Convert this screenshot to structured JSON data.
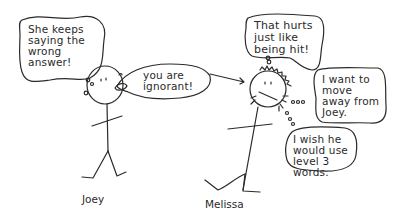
{
  "characters": {
    "joey": {
      "name": "Joey"
    },
    "melissa": {
      "name": "Melissa"
    }
  },
  "bubbles": {
    "joey_thought": "She keeps\nsaying the\nwrong\nanswer!",
    "joey_speech": "you are\nignorant!",
    "melissa_thought_1": "That hurts\njust like\nbeing hit!",
    "melissa_thought_2": "I want to\nmove\naway from\nJoey.",
    "melissa_thought_3": "I wish he\nwould use\nlevel 3\nwords."
  },
  "colors": {
    "ink": "#2a2a2a",
    "background": "#ffffff"
  }
}
